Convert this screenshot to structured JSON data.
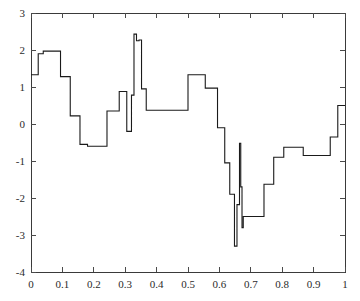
{
  "chart_data": {
    "type": "line",
    "title": "",
    "subtitle": "",
    "xlabel": "",
    "ylabel": "",
    "xlim": [
      0,
      1
    ],
    "ylim": [
      -4,
      3
    ],
    "grid": false,
    "legend": null,
    "annotations": [],
    "line_style": "piecewise-constant-step",
    "line_color": "#1a1a1a",
    "xticks": [
      0,
      0.1,
      0.2,
      0.3,
      0.4,
      0.5,
      0.6,
      0.7,
      0.8,
      0.9,
      1
    ],
    "xtick_labels": [
      "0",
      "0.1",
      "0.2",
      "0.3",
      "0.4",
      "0.5",
      "0.6",
      "0.7",
      "0.8",
      "0.9",
      "1"
    ],
    "yticks": [
      -4,
      -3,
      -2,
      -1,
      0,
      1,
      2,
      3
    ],
    "ytick_labels": [
      "-4",
      "-3",
      "-2",
      "-1",
      "0",
      "1",
      "2",
      "3"
    ],
    "series": [
      {
        "name": "signal",
        "x": [
          0.0,
          0.023,
          0.023,
          0.039,
          0.039,
          0.055,
          0.055,
          0.094,
          0.094,
          0.125,
          0.125,
          0.156,
          0.156,
          0.18,
          0.18,
          0.242,
          0.242,
          0.281,
          0.281,
          0.305,
          0.305,
          0.32,
          0.32,
          0.328,
          0.328,
          0.336,
          0.336,
          0.344,
          0.344,
          0.352,
          0.352,
          0.367,
          0.367,
          0.383,
          0.383,
          0.5,
          0.5,
          0.555,
          0.555,
          0.594,
          0.594,
          0.617,
          0.617,
          0.633,
          0.633,
          0.648,
          0.648,
          0.656,
          0.656,
          0.664,
          0.664,
          0.668,
          0.668,
          0.672,
          0.672,
          0.676,
          0.676,
          0.68,
          0.68,
          0.695,
          0.695,
          0.742,
          0.742,
          0.773,
          0.773,
          0.805,
          0.805,
          0.867,
          0.867,
          0.922,
          0.922,
          0.953,
          0.953,
          0.977,
          0.977,
          1.0
        ],
        "y": [
          1.33,
          1.33,
          1.9,
          1.9,
          1.97,
          1.97,
          1.28,
          1.28,
          0.22,
          0.22,
          -0.55,
          -0.55,
          -0.6,
          -0.6,
          0.35,
          0.35,
          0.35,
          0.35,
          0.88,
          0.88,
          -0.2,
          -0.2,
          0.78,
          0.78,
          2.43,
          2.43,
          2.25,
          2.25,
          2.27,
          2.27,
          0.95,
          0.95,
          0.37,
          0.37,
          0.37,
          0.37,
          1.33,
          1.33,
          0.97,
          0.97,
          -0.1,
          -0.1,
          -1.05,
          -1.05,
          -1.9,
          -1.9,
          -3.3,
          -3.3,
          -2.18,
          -2.18,
          -0.52,
          -0.52,
          -1.7,
          -1.7,
          -2.8,
          -2.8,
          -2.5,
          -2.5,
          -2.5,
          -2.5,
          -2.5,
          -2.5,
          -1.63,
          -1.63,
          -0.9,
          -0.9,
          -0.63,
          -0.63,
          -0.85,
          -0.85,
          -0.85,
          -0.85,
          -0.35,
          -0.35,
          0.5,
          0.5
        ]
      }
    ],
    "segments": [
      {
        "x0": 0.0,
        "x1": 0.023,
        "value": 1.33
      },
      {
        "x0": 0.023,
        "x1": 0.039,
        "value": 1.9
      },
      {
        "x0": 0.039,
        "x1": 0.055,
        "value": 1.97
      },
      {
        "x0": 0.055,
        "x1": 0.094,
        "value": 1.97
      },
      {
        "x0": 0.094,
        "x1": 0.125,
        "value": 1.28
      },
      {
        "x0": 0.125,
        "x1": 0.156,
        "value": 0.22
      },
      {
        "x0": 0.156,
        "x1": 0.18,
        "value": -0.55
      },
      {
        "x0": 0.18,
        "x1": 0.242,
        "value": -0.6
      },
      {
        "x0": 0.242,
        "x1": 0.281,
        "value": 0.35
      },
      {
        "x0": 0.281,
        "x1": 0.305,
        "value": 0.88
      },
      {
        "x0": 0.305,
        "x1": 0.32,
        "value": -0.2
      },
      {
        "x0": 0.32,
        "x1": 0.328,
        "value": 0.78
      },
      {
        "x0": 0.328,
        "x1": 0.336,
        "value": 2.43
      },
      {
        "x0": 0.336,
        "x1": 0.344,
        "value": 2.25
      },
      {
        "x0": 0.344,
        "x1": 0.352,
        "value": 2.27
      },
      {
        "x0": 0.352,
        "x1": 0.367,
        "value": 0.95
      },
      {
        "x0": 0.367,
        "x1": 0.5,
        "value": 0.37
      },
      {
        "x0": 0.5,
        "x1": 0.555,
        "value": 1.33
      },
      {
        "x0": 0.555,
        "x1": 0.594,
        "value": 0.97
      },
      {
        "x0": 0.594,
        "x1": 0.617,
        "value": -0.1
      },
      {
        "x0": 0.617,
        "x1": 0.633,
        "value": -1.05
      },
      {
        "x0": 0.633,
        "x1": 0.648,
        "value": -1.9
      },
      {
        "x0": 0.648,
        "x1": 0.656,
        "value": -3.3
      },
      {
        "x0": 0.656,
        "x1": 0.664,
        "value": -2.18
      },
      {
        "x0": 0.664,
        "x1": 0.668,
        "value": -0.52
      },
      {
        "x0": 0.668,
        "x1": 0.672,
        "value": -1.7
      },
      {
        "x0": 0.672,
        "x1": 0.676,
        "value": -2.8
      },
      {
        "x0": 0.676,
        "x1": 0.742,
        "value": -2.5
      },
      {
        "x0": 0.742,
        "x1": 0.773,
        "value": -1.63
      },
      {
        "x0": 0.773,
        "x1": 0.805,
        "value": -0.9
      },
      {
        "x0": 0.805,
        "x1": 0.867,
        "value": -0.63
      },
      {
        "x0": 0.867,
        "x1": 0.953,
        "value": -0.85
      },
      {
        "x0": 0.953,
        "x1": 0.977,
        "value": -0.35
      },
      {
        "x0": 0.977,
        "x1": 1.0,
        "value": 0.5
      }
    ]
  },
  "layout": {
    "plot_left": 31,
    "plot_right": 345,
    "plot_top": 13,
    "plot_bottom": 272,
    "tick_len": 5
  }
}
